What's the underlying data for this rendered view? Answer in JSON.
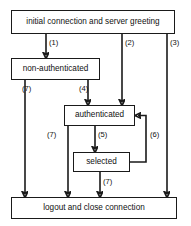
{
  "diagram": {
    "type": "state-flow",
    "colors": {
      "stroke": "#1a1a1a",
      "background": "#ffffff",
      "text": "#111111"
    },
    "nodes": [
      {
        "id": "initial",
        "label": "initial connection and server greeting"
      },
      {
        "id": "nonauth",
        "label": "non-authenticated"
      },
      {
        "id": "auth",
        "label": "authenticated"
      },
      {
        "id": "selected",
        "label": "selected"
      },
      {
        "id": "logout",
        "label": "logout and close connection"
      }
    ],
    "edges": [
      {
        "id": "e1",
        "from": "initial",
        "to": "nonauth",
        "label": "(1)"
      },
      {
        "id": "e2",
        "from": "initial",
        "to": "auth",
        "label": "(2)"
      },
      {
        "id": "e3",
        "from": "initial",
        "to": "logout",
        "label": "(3)"
      },
      {
        "id": "e4",
        "from": "nonauth",
        "to": "auth",
        "label": "(4)"
      },
      {
        "id": "e7a",
        "from": "nonauth",
        "to": "logout",
        "label": "(7)"
      },
      {
        "id": "e5",
        "from": "auth",
        "to": "selected",
        "label": "(5)"
      },
      {
        "id": "e7b",
        "from": "auth",
        "to": "logout",
        "label": "(7)"
      },
      {
        "id": "e6",
        "from": "selected",
        "to": "auth",
        "label": "(6)"
      },
      {
        "id": "e7c",
        "from": "selected",
        "to": "logout",
        "label": "(7)"
      }
    ]
  }
}
